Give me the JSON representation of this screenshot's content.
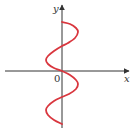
{
  "chart_data": {
    "type": "line",
    "title": "",
    "xlabel": "x",
    "ylabel": "y",
    "origin_label": "0",
    "grid": false,
    "legend": null,
    "series": [
      {
        "name": "curve",
        "color": "#d9363e",
        "points_px": [
          [
            62,
            22
          ],
          [
            70,
            24
          ],
          [
            76,
            28
          ],
          [
            78,
            32
          ],
          [
            75,
            38
          ],
          [
            68,
            43
          ],
          [
            62,
            46
          ],
          [
            54,
            51
          ],
          [
            48,
            56
          ],
          [
            46,
            60
          ],
          [
            48,
            64
          ],
          [
            54,
            68
          ],
          [
            62,
            71
          ],
          [
            70,
            75
          ],
          [
            76,
            80
          ],
          [
            78,
            84
          ],
          [
            76,
            89
          ],
          [
            69,
            94
          ],
          [
            62,
            97
          ],
          [
            54,
            101
          ],
          [
            48,
            106
          ],
          [
            46,
            110
          ],
          [
            48,
            115
          ],
          [
            54,
            120
          ],
          [
            62,
            124
          ]
        ]
      }
    ],
    "axes": {
      "x_axis": {
        "y_px": 71,
        "x_start_px": 5,
        "x_end_px": 128
      },
      "y_axis": {
        "x_px": 62,
        "y_start_px": 128,
        "y_end_px": 6
      }
    }
  },
  "labels": {
    "x": "x",
    "y": "y",
    "origin": "0"
  },
  "colors": {
    "curve": "#d9363e",
    "axis": "#333333"
  }
}
